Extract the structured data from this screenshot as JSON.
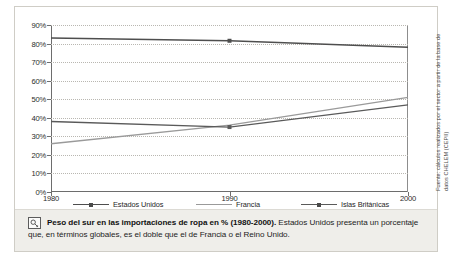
{
  "chart_data": {
    "type": "line",
    "title": "",
    "xlabel": "",
    "ylabel": "",
    "x": [
      1980,
      1990,
      2000
    ],
    "xlim": [
      1980,
      2000
    ],
    "ylim": [
      0,
      90
    ],
    "grid": true,
    "legend_position": "bottom",
    "y_ticks": [
      "0%",
      "10%",
      "20%",
      "30%",
      "40%",
      "50%",
      "60%",
      "70%",
      "80%",
      "90%"
    ],
    "y_tick_values": [
      0,
      10,
      20,
      30,
      40,
      50,
      60,
      70,
      80,
      90
    ],
    "x_ticks": [
      "1980",
      "1990",
      "2000"
    ],
    "series": [
      {
        "name": "Estados Unidos",
        "values": [
          83,
          81.5,
          78
        ],
        "color": "#4e4e4e",
        "markers": true
      },
      {
        "name": "Francia",
        "values": [
          26,
          36,
          51
        ],
        "color": "#9a9a9a",
        "markers": false
      },
      {
        "name": "Islas Británicas",
        "values": [
          38,
          35,
          47
        ],
        "color": "#5a5a5a",
        "markers": true
      }
    ]
  },
  "source_note": "Fuente: cálculos realizados por el sector a partir de la base de datos CHELEM (CEPII)",
  "caption": {
    "icon": "magnifier-key-icon",
    "bold_text": "Peso del sur en las importaciones de ropa en % (1980-2000).",
    "rest_text": " Estados Unidos presenta un porcentaje que, en términos globales, es el doble que el de Francia o el Reino Unido."
  }
}
